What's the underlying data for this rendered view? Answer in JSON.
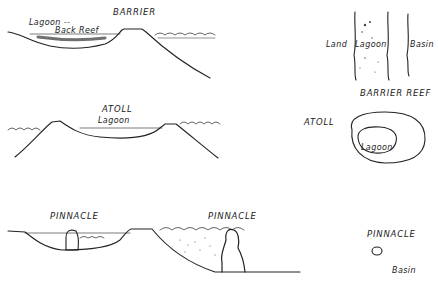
{
  "diagram": {
    "cross_sections": {
      "barrier": {
        "title": "BARRIER",
        "labels": [
          "Lagoon --",
          "Back Reef"
        ]
      },
      "atoll": {
        "title": "ATOLL",
        "labels": [
          "Lagoon"
        ]
      },
      "pinnacle_left": {
        "title": "PINNACLE"
      },
      "pinnacle_right": {
        "title": "PINNACLE"
      }
    },
    "plan_views": {
      "barrier_reef": {
        "title": "BARRIER REEF",
        "labels": {
          "land": "Land",
          "lagoon": "Lagoon",
          "basin": "Basin"
        }
      },
      "atoll": {
        "title": "ATOLL",
        "labels": {
          "lagoon": "Lagoon"
        }
      },
      "pinnacle": {
        "title": "PINNACLE",
        "labels": {
          "basin": "Basin"
        }
      }
    },
    "colors": {
      "ink": "#222222",
      "background": "#ffffff"
    }
  }
}
